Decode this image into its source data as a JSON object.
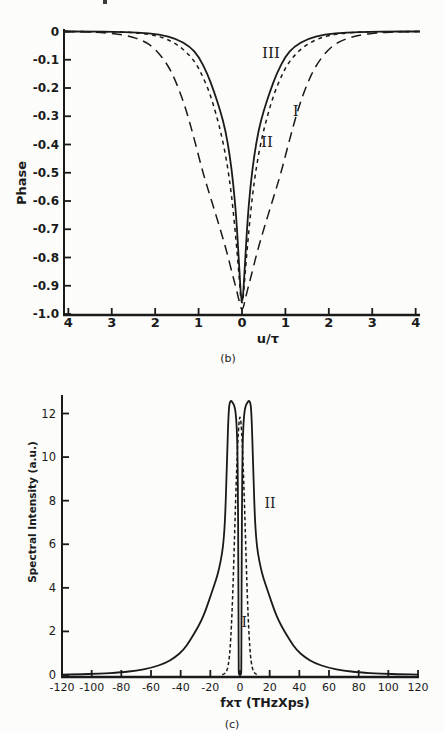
{
  "page": {
    "background": "#fcfcfa",
    "ink": "#1a1a1a"
  },
  "chart_data": [
    {
      "id": "b",
      "type": "line",
      "title": "",
      "xlabel": "u/τ",
      "ylabel": "Phase",
      "caption": "(b)",
      "xlim": [
        -4.1,
        4.1
      ],
      "ylim": [
        -1.0,
        0.0
      ],
      "grid": false,
      "x_tick_values": [
        -4,
        -3,
        -2,
        -1,
        0,
        1,
        2,
        3,
        4
      ],
      "x_tick_labels": [
        "4",
        "3",
        "2",
        "1",
        "0",
        "1",
        "2",
        "3",
        "4"
      ],
      "y_tick_values": [
        0,
        -0.1,
        -0.2,
        -0.3,
        -0.4,
        -0.5,
        -0.6,
        -0.7,
        -0.8,
        -0.9,
        -1.0
      ],
      "y_tick_labels": [
        "0",
        "-0.1",
        "-0.2",
        "-0.3",
        "-0.4",
        "-0.5",
        "-0.6",
        "-0.7",
        "-0.8",
        "-0.9",
        "-1.0"
      ],
      "series": [
        {
          "name": "I",
          "style": "long-dash",
          "label": "I",
          "label_pos": [
            1.24,
            -0.281
          ],
          "points": [
            [
              -4.1,
              0
            ],
            [
              -3.6,
              -0.001
            ],
            [
              -3.2,
              -0.004
            ],
            [
              -2.7,
              -0.012
            ],
            [
              -2.3,
              -0.03
            ],
            [
              -2.0,
              -0.06
            ],
            [
              -1.7,
              -0.12
            ],
            [
              -1.5,
              -0.185
            ],
            [
              -1.3,
              -0.27
            ],
            [
              -1.1,
              -0.38
            ],
            [
              -0.9,
              -0.5
            ],
            [
              -0.7,
              -0.6
            ],
            [
              -0.5,
              -0.7
            ],
            [
              -0.35,
              -0.78
            ],
            [
              -0.22,
              -0.86
            ],
            [
              -0.1,
              -0.93
            ],
            [
              0,
              -1.0
            ],
            [
              0.1,
              -0.93
            ],
            [
              0.22,
              -0.86
            ],
            [
              0.35,
              -0.78
            ],
            [
              0.5,
              -0.7
            ],
            [
              0.7,
              -0.6
            ],
            [
              0.9,
              -0.5
            ],
            [
              1.1,
              -0.38
            ],
            [
              1.3,
              -0.27
            ],
            [
              1.5,
              -0.185
            ],
            [
              1.7,
              -0.12
            ],
            [
              2.0,
              -0.06
            ],
            [
              2.3,
              -0.03
            ],
            [
              2.7,
              -0.012
            ],
            [
              3.2,
              -0.004
            ],
            [
              3.6,
              -0.001
            ],
            [
              4.1,
              0
            ]
          ]
        },
        {
          "name": "II",
          "style": "short-dash",
          "label": "II",
          "label_pos": [
            0.576,
            -0.391
          ],
          "points": [
            [
              -4.1,
              0
            ],
            [
              -3,
              -0.001
            ],
            [
              -2.7,
              -0.002
            ],
            [
              -2.2,
              -0.008
            ],
            [
              -1.8,
              -0.022
            ],
            [
              -1.5,
              -0.045
            ],
            [
              -1.25,
              -0.077
            ],
            [
              -1.05,
              -0.115
            ],
            [
              -0.9,
              -0.16
            ],
            [
              -0.75,
              -0.215
            ],
            [
              -0.6,
              -0.29
            ],
            [
              -0.45,
              -0.38
            ],
            [
              -0.33,
              -0.48
            ],
            [
              -0.24,
              -0.58
            ],
            [
              -0.16,
              -0.7
            ],
            [
              -0.08,
              -0.84
            ],
            [
              0,
              -1.0
            ],
            [
              0.08,
              -0.84
            ],
            [
              0.16,
              -0.7
            ],
            [
              0.24,
              -0.58
            ],
            [
              0.33,
              -0.48
            ],
            [
              0.45,
              -0.38
            ],
            [
              0.6,
              -0.29
            ],
            [
              0.75,
              -0.215
            ],
            [
              0.9,
              -0.16
            ],
            [
              1.05,
              -0.115
            ],
            [
              1.25,
              -0.077
            ],
            [
              1.5,
              -0.045
            ],
            [
              1.8,
              -0.022
            ],
            [
              2.2,
              -0.008
            ],
            [
              2.7,
              -0.002
            ],
            [
              3,
              -0.001
            ],
            [
              4.1,
              0
            ]
          ]
        },
        {
          "name": "III",
          "style": "solid",
          "label": "III",
          "label_pos": [
            0.668,
            -0.076
          ],
          "points": [
            [
              -4.1,
              0
            ],
            [
              -3.4,
              0
            ],
            [
              -3,
              -0.001
            ],
            [
              -2.4,
              -0.003
            ],
            [
              -1.9,
              -0.01
            ],
            [
              -1.5,
              -0.026
            ],
            [
              -1.2,
              -0.053
            ],
            [
              -1.0,
              -0.088
            ],
            [
              -0.8,
              -0.148
            ],
            [
              -0.65,
              -0.21
            ],
            [
              -0.5,
              -0.28
            ],
            [
              -0.38,
              -0.35
            ],
            [
              -0.28,
              -0.44
            ],
            [
              -0.2,
              -0.54
            ],
            [
              -0.13,
              -0.66
            ],
            [
              -0.07,
              -0.82
            ],
            [
              0,
              -1.0
            ],
            [
              0.07,
              -0.82
            ],
            [
              0.13,
              -0.66
            ],
            [
              0.2,
              -0.54
            ],
            [
              0.28,
              -0.44
            ],
            [
              0.38,
              -0.35
            ],
            [
              0.5,
              -0.28
            ],
            [
              0.65,
              -0.21
            ],
            [
              0.8,
              -0.148
            ],
            [
              1.0,
              -0.088
            ],
            [
              1.2,
              -0.053
            ],
            [
              1.5,
              -0.026
            ],
            [
              1.9,
              -0.01
            ],
            [
              2.4,
              -0.003
            ],
            [
              3,
              -0.001
            ],
            [
              3.4,
              0
            ],
            [
              4.1,
              0
            ]
          ]
        }
      ]
    },
    {
      "id": "c",
      "type": "line",
      "title": "",
      "xlabel": "fxτ (THzXps)",
      "ylabel": "Spectral Intensity (a.u.)",
      "caption": "(c)",
      "xlim": [
        -120,
        120
      ],
      "ylim": [
        0,
        12
      ],
      "grid": false,
      "x_tick_values": [
        -120,
        -100,
        -80,
        -60,
        -40,
        -20,
        0,
        20,
        40,
        60,
        80,
        100,
        120
      ],
      "x_tick_labels": [
        "-120",
        "-100",
        "-80",
        "-60",
        "-40",
        "-20",
        "0",
        "20",
        "40",
        "60",
        "80",
        "100",
        "120"
      ],
      "y_tick_values": [
        0,
        2,
        4,
        6,
        8,
        10,
        12
      ],
      "y_tick_labels": [
        "0",
        "2",
        "4",
        "6",
        "8",
        "10",
        "12"
      ],
      "series": [
        {
          "name": "II",
          "style": "solid",
          "label": "II",
          "label_pos": [
            20.2,
            7.9
          ],
          "points": [
            [
              -120,
              0.02
            ],
            [
              -110,
              0.03
            ],
            [
              -95,
              0.06
            ],
            [
              -80,
              0.12
            ],
            [
              -70,
              0.2
            ],
            [
              -60,
              0.32
            ],
            [
              -50,
              0.55
            ],
            [
              -44,
              0.8
            ],
            [
              -38,
              1.15
            ],
            [
              -34,
              1.55
            ],
            [
              -30,
              2.0
            ],
            [
              -26,
              2.5
            ],
            [
              -23,
              3.0
            ],
            [
              -20,
              3.6
            ],
            [
              -18,
              4.0
            ],
            [
              -16,
              4.4
            ],
            [
              -14,
              4.9
            ],
            [
              -12,
              5.6
            ],
            [
              -11,
              6.2
            ],
            [
              -10,
              7.2
            ],
            [
              -9,
              9.3
            ],
            [
              -8.5,
              10.4
            ],
            [
              -8,
              11.5
            ],
            [
              -7.5,
              12.2
            ],
            [
              -7,
              12.5
            ],
            [
              -6,
              12.6
            ],
            [
              -5,
              12.5
            ],
            [
              -4,
              12.4
            ],
            [
              -3,
              12.1
            ],
            [
              -2.2,
              11.4
            ],
            [
              -1.7,
              10.3
            ],
            [
              -1.4,
              8.5
            ],
            [
              -1.15,
              5.5
            ],
            [
              -1.0,
              2.5
            ],
            [
              -0.9,
              0.5
            ],
            [
              -0.85,
              0.05
            ],
            [
              -0.5,
              0.02
            ],
            [
              0.5,
              0.02
            ],
            [
              0.85,
              0.05
            ],
            [
              0.9,
              0.5
            ],
            [
              1.0,
              2.5
            ],
            [
              1.15,
              5.5
            ],
            [
              1.4,
              8.5
            ],
            [
              1.7,
              10.3
            ],
            [
              2.2,
              11.4
            ],
            [
              3,
              12.1
            ],
            [
              4,
              12.4
            ],
            [
              5,
              12.5
            ],
            [
              6,
              12.6
            ],
            [
              7,
              12.5
            ],
            [
              7.5,
              12.2
            ],
            [
              8,
              11.5
            ],
            [
              8.5,
              10.4
            ],
            [
              9,
              9.3
            ],
            [
              10,
              7.2
            ],
            [
              11,
              6.2
            ],
            [
              12,
              5.6
            ],
            [
              14,
              4.9
            ],
            [
              16,
              4.4
            ],
            [
              18,
              4.0
            ],
            [
              20,
              3.6
            ],
            [
              23,
              3.0
            ],
            [
              26,
              2.5
            ],
            [
              30,
              2.0
            ],
            [
              34,
              1.55
            ],
            [
              38,
              1.15
            ],
            [
              44,
              0.8
            ],
            [
              50,
              0.55
            ],
            [
              60,
              0.32
            ],
            [
              70,
              0.2
            ],
            [
              80,
              0.12
            ],
            [
              95,
              0.06
            ],
            [
              110,
              0.03
            ],
            [
              120,
              0.02
            ]
          ]
        },
        {
          "name": "I",
          "style": "dash",
          "label": "I",
          "label_pos": [
            2.8,
            2.45
          ],
          "points": [
            [
              -12,
              0.01
            ],
            [
              -10.5,
              0.05
            ],
            [
              -9,
              0.16
            ],
            [
              -8,
              0.4
            ],
            [
              -7,
              0.9
            ],
            [
              -6.2,
              1.7
            ],
            [
              -5.4,
              2.8
            ],
            [
              -4.6,
              4.3
            ],
            [
              -3.8,
              6.1
            ],
            [
              -3,
              7.9
            ],
            [
              -2.2,
              9.5
            ],
            [
              -1.5,
              10.7
            ],
            [
              -0.7,
              11.6
            ],
            [
              0,
              11.9
            ],
            [
              0.7,
              11.6
            ],
            [
              1.5,
              10.7
            ],
            [
              2.2,
              9.5
            ],
            [
              3,
              7.9
            ],
            [
              3.8,
              6.1
            ],
            [
              4.6,
              4.3
            ],
            [
              5.4,
              2.8
            ],
            [
              6.2,
              1.7
            ],
            [
              7,
              0.9
            ],
            [
              8,
              0.4
            ],
            [
              9,
              0.16
            ],
            [
              10.5,
              0.05
            ],
            [
              12,
              0.01
            ]
          ]
        }
      ]
    }
  ]
}
